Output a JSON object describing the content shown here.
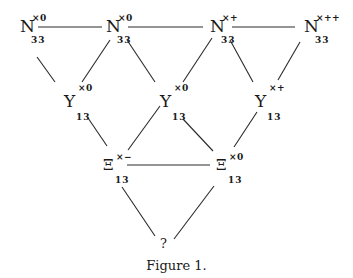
{
  "figure": {
    "caption": "Figure 1.",
    "nodes": {
      "n1": {
        "symbol": "N",
        "sup": "×0",
        "sub": "33"
      },
      "n2": {
        "symbol": "N",
        "sup": "×0",
        "sub": "33"
      },
      "n3": {
        "symbol": "N",
        "sup": "×+",
        "sub": "33"
      },
      "n4": {
        "symbol": "N",
        "sup": "×++",
        "sub": "33"
      },
      "y1": {
        "symbol": "Y",
        "sup": "×0",
        "sub": "13"
      },
      "y2": {
        "symbol": "Y",
        "sup": "×0",
        "sub": "13"
      },
      "y3": {
        "symbol": "Y",
        "sup": "×+",
        "sub": "13"
      },
      "x1": {
        "symbol": "Ξ",
        "sup": "×−",
        "sub": "13"
      },
      "x2": {
        "symbol": "Ξ",
        "sup": "×0",
        "sub": "13"
      },
      "q": {
        "symbol": "?"
      }
    },
    "edges": [
      [
        "n1",
        "n2"
      ],
      [
        "n2",
        "n3"
      ],
      [
        "n3",
        "n4"
      ],
      [
        "n1",
        "y1"
      ],
      [
        "n2",
        "y1"
      ],
      [
        "n2",
        "y2"
      ],
      [
        "n3",
        "y2"
      ],
      [
        "n3",
        "y3"
      ],
      [
        "n4",
        "y3"
      ],
      [
        "y1",
        "x1"
      ],
      [
        "y2",
        "x1"
      ],
      [
        "y2",
        "x2"
      ],
      [
        "y3",
        "x2"
      ],
      [
        "x1",
        "x2"
      ],
      [
        "x1",
        "q"
      ],
      [
        "x2",
        "q"
      ]
    ]
  }
}
